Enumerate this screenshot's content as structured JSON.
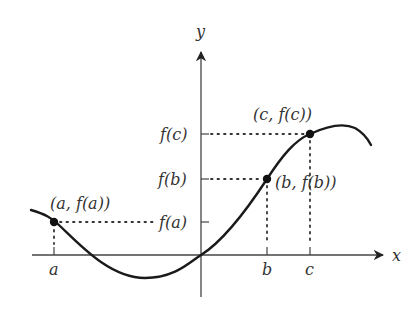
{
  "figure": {
    "axes": {
      "x_label": "x",
      "y_label": "y"
    },
    "x_ticks": [
      {
        "id": "a",
        "label": "a"
      },
      {
        "id": "b",
        "label": "b"
      },
      {
        "id": "c",
        "label": "c"
      }
    ],
    "y_ticks": [
      {
        "id": "fa",
        "label": "f(a)"
      },
      {
        "id": "fb",
        "label": "f(b)"
      },
      {
        "id": "fc",
        "label": "f(c)"
      }
    ],
    "points": [
      {
        "id": "A",
        "label": "(a, f(a))"
      },
      {
        "id": "B",
        "label": "(b, f(b))"
      },
      {
        "id": "C",
        "label": "(c, f(c))"
      }
    ],
    "colors": {
      "curve": "#1a1a1a",
      "axis": "#333333",
      "text": "#333333",
      "background": "#ffffff"
    }
  }
}
